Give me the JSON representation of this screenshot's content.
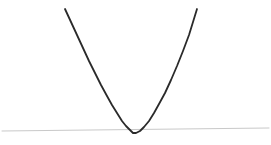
{
  "figure": {
    "width": 271,
    "height": 145,
    "background_color": "#ffffff",
    "title": "",
    "has_text_labels": false
  },
  "style": {
    "curve_color": "#2a2a2a",
    "curve_width": 1.8,
    "axis_color": "#c9c9c9",
    "axis_width": 1.0
  },
  "chart_data": {
    "type": "line",
    "title": "",
    "xlabel": "",
    "ylabel": "",
    "grid": false,
    "legend": null,
    "xlim": [
      0,
      271
    ],
    "ylim": [
      145,
      0
    ],
    "series": [
      {
        "name": "parabola",
        "color": "#2a2a2a",
        "comment": "Upward-opening parabola in pixel coordinates; vertex near (133, 133), arms rise to y=9",
        "x": [
          65,
          71,
          77,
          83,
          89,
          95,
          101,
          107,
          112,
          117,
          122,
          126,
          130,
          133,
          136,
          140,
          144,
          149,
          154,
          159,
          165,
          171,
          177,
          183,
          189,
          197
        ],
        "y": [
          9,
          22,
          35,
          48,
          61,
          73,
          85,
          96,
          105,
          113,
          121,
          126,
          130,
          133,
          133,
          131,
          127,
          121,
          113,
          104,
          93,
          80,
          66,
          51,
          35,
          9
        ]
      },
      {
        "name": "horizontal-axis-line",
        "color": "#c9c9c9",
        "comment": "Faint near-horizontal baseline, tilted slightly upward toward the right",
        "x": [
          2,
          269
        ],
        "y": [
          131,
          128
        ]
      }
    ],
    "annotations": [],
    "tick_labels": {
      "x": [],
      "y": []
    }
  }
}
